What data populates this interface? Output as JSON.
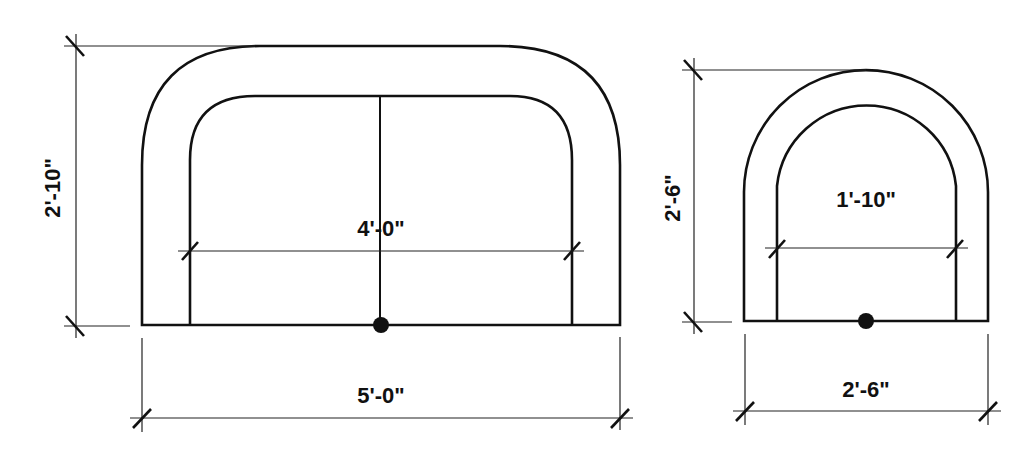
{
  "diagram": {
    "type": "architectural section dimensions",
    "left_shape": {
      "name": "wide rounded U channel",
      "overall_height_label": "2'-10\"",
      "inner_width_label": "4'-0\"",
      "overall_width_label": "5'-0\""
    },
    "right_shape": {
      "name": "narrow arched U channel",
      "overall_height_label": "2'-6\"",
      "inner_width_label": "1'-10\"",
      "overall_width_label": "2'-6\""
    },
    "colors": {
      "line": "#111111",
      "background": "#ffffff"
    }
  }
}
